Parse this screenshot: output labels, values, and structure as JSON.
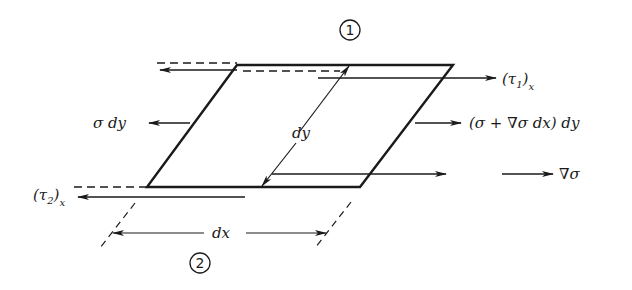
{
  "diagram": {
    "type": "free-body element diagram (stress on differential element)",
    "face_labels": {
      "top": "1",
      "bottom": "2"
    },
    "labels": {
      "tau1": "(τ",
      "tau1_sub": "1",
      "tau1_close": ")",
      "tau1_x": "x",
      "tau2": "(τ",
      "tau2_sub": "2",
      "tau2_close": ")",
      "tau2_x": "x",
      "sigma_dy": "σ dy",
      "sigma_plus": "(σ + ∇σ dx) dy",
      "dy": "dy",
      "dx": "dx",
      "grad_sigma": "∇σ"
    },
    "colors": {
      "ink": "#1a1a1a",
      "background": "#ffffff"
    }
  }
}
